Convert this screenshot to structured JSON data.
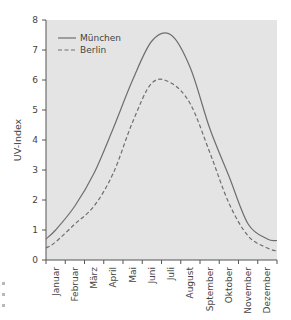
{
  "chart_data": {
    "type": "line",
    "title": "",
    "xlabel": "",
    "ylabel": "UV-Index",
    "categories": [
      "Januar",
      "Februar",
      "März",
      "April",
      "Mai",
      "Juni",
      "Juli",
      "August",
      "Sptember",
      "Oktober",
      "November",
      "Dezember"
    ],
    "series": [
      {
        "name": "München",
        "style": "solid",
        "values": [
          1.0,
          1.8,
          2.9,
          4.4,
          6.0,
          7.3,
          7.5,
          6.4,
          4.4,
          2.8,
          1.2,
          0.7
        ],
        "start": 0.7,
        "end": 0.65,
        "peak": 7.6
      },
      {
        "name": "Berlin",
        "style": "dashed",
        "values": [
          0.6,
          1.2,
          1.8,
          2.9,
          4.6,
          5.9,
          5.9,
          5.2,
          3.6,
          1.9,
          0.8,
          0.4
        ],
        "start": 0.4,
        "end": 0.3,
        "peak": 6.05
      }
    ],
    "ylim": [
      0,
      8
    ],
    "yticks": [
      "0",
      "1",
      "2",
      "3",
      "4",
      "5",
      "6",
      "7",
      "8"
    ],
    "grid": false,
    "legend_position": "upper-left",
    "colors": {
      "plot_background": "#e4e4e4",
      "line": "#6e6e6e",
      "axis": "#555555"
    }
  }
}
